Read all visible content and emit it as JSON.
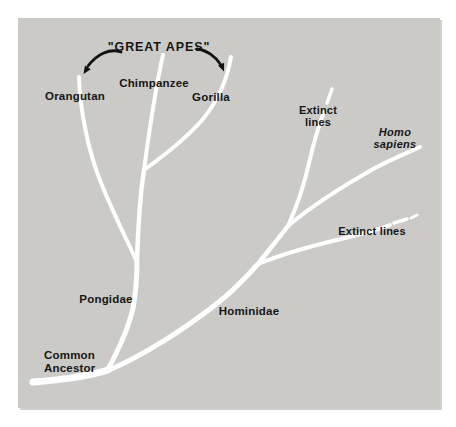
{
  "figure": {
    "type": "evolutionary-tree-diagram",
    "title": "\"GREAT APES\""
  },
  "labels": {
    "orangutan": "Orangutan",
    "chimpanzee": "Chimpanzee",
    "gorilla": "Gorilla",
    "extinct_upper": "Extinct\nlines",
    "homo_sapiens": "Homo sapiens",
    "extinct_lower": "Extinct lines",
    "pongidae": "Pongidae",
    "hominidae": "Hominidae",
    "common_ancestor": "Common\nAncestor"
  },
  "colors": {
    "panel_background": "#cbcac7",
    "page_background": "#ffffff",
    "branch": "#ffffff",
    "text": "#161616",
    "arrow": "#111111"
  }
}
